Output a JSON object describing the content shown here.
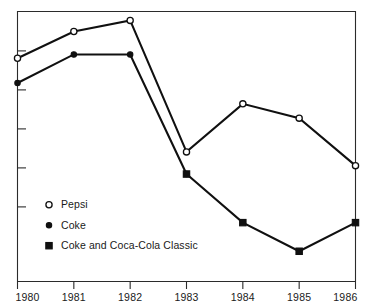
{
  "chart_data": {
    "type": "line",
    "title": "",
    "subtitle": "",
    "xlabel": "",
    "ylabel": "",
    "grid": false,
    "legend_position": "inside-lower-left",
    "categories": [
      "1980",
      "1981",
      "1982",
      "1983",
      "1984",
      "1985",
      "1986"
    ],
    "x_tick_labels": [
      "1980",
      "1981",
      "1982",
      "1983",
      "1984",
      "1985",
      "1986"
    ],
    "y_tick_labels": [],
    "y_tick_count": 5,
    "xlim": [
      1980,
      1986
    ],
    "ylim": [
      0,
      100
    ],
    "series": [
      {
        "name": "Pepsi",
        "marker": "open-circle",
        "x": [
          "1980",
          "1981",
          "1982",
          "1983",
          "1984",
          "1985",
          "1986"
        ],
        "values": [
          82.7,
          92.6,
          96.7,
          48.0,
          65.8,
          60.5,
          42.9
        ]
      },
      {
        "name": "Coke",
        "marker": "filled-circle",
        "x": [
          "1980",
          "1981",
          "1982",
          "1983"
        ],
        "values": [
          73.5,
          84.1,
          84.1,
          39.8
        ]
      },
      {
        "name": "Coke and Coca-Cola Classic",
        "marker": "filled-square",
        "x": [
          "1983",
          "1984",
          "1985",
          "1986"
        ],
        "values": [
          39.8,
          21.8,
          11.2,
          21.8
        ]
      }
    ],
    "legend": [
      {
        "label": "Pepsi",
        "marker": "open-circle"
      },
      {
        "label": "Coke",
        "marker": "filled-circle"
      },
      {
        "label": "Coke and Coca-Cola Classic",
        "marker": "filled-square"
      }
    ],
    "colors": {
      "line": "#101010",
      "axis": "#2b2b2b",
      "background": "#ffffff",
      "text": "#1a1a1a"
    }
  }
}
